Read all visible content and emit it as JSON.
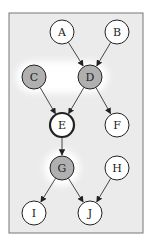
{
  "diagram": {
    "type": "bayesian-network",
    "frame": {
      "x": 9,
      "y": 13,
      "w": 134,
      "h": 220,
      "fill": "#ebebeb",
      "stroke": "#777777"
    },
    "highlight_fill": "#ffffff",
    "colors": {
      "observed": "#b0b0b0",
      "unobserved": "#ffffff",
      "edge": "#333333"
    },
    "nodes": [
      {
        "id": "A",
        "label": "A",
        "x": 62,
        "y": 32,
        "shaded": false,
        "bold": false
      },
      {
        "id": "B",
        "label": "B",
        "x": 117,
        "y": 32,
        "shaded": false,
        "bold": false
      },
      {
        "id": "C",
        "label": "C",
        "x": 34,
        "y": 77,
        "shaded": true,
        "bold": false
      },
      {
        "id": "D",
        "label": "D",
        "x": 90,
        "y": 77,
        "shaded": true,
        "bold": false
      },
      {
        "id": "E",
        "label": "E",
        "x": 62,
        "y": 125,
        "shaded": false,
        "bold": true
      },
      {
        "id": "F",
        "label": "F",
        "x": 117,
        "y": 125,
        "shaded": false,
        "bold": false
      },
      {
        "id": "G",
        "label": "G",
        "x": 62,
        "y": 168,
        "shaded": true,
        "bold": false
      },
      {
        "id": "H",
        "label": "H",
        "x": 117,
        "y": 168,
        "shaded": false,
        "bold": false
      },
      {
        "id": "I",
        "label": "I",
        "x": 34,
        "y": 213,
        "shaded": false,
        "bold": false
      },
      {
        "id": "J",
        "label": "J",
        "x": 90,
        "y": 213,
        "shaded": false,
        "bold": false
      }
    ],
    "edges": [
      {
        "from": "A",
        "to": "D"
      },
      {
        "from": "B",
        "to": "D"
      },
      {
        "from": "C",
        "to": "E"
      },
      {
        "from": "D",
        "to": "E"
      },
      {
        "from": "D",
        "to": "F"
      },
      {
        "from": "E",
        "to": "G"
      },
      {
        "from": "G",
        "to": "I"
      },
      {
        "from": "G",
        "to": "J"
      },
      {
        "from": "H",
        "to": "J"
      }
    ]
  }
}
